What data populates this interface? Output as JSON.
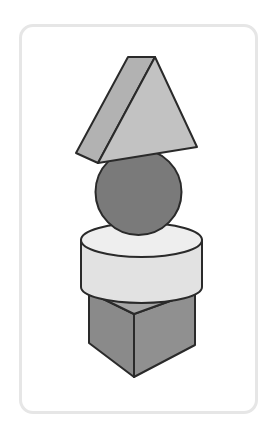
{
  "figure": {
    "stack_order_top_to_bottom": [
      "triangular-prism",
      "sphere",
      "cylinder",
      "cube"
    ],
    "colors": {
      "card_border": "#e6e6e6",
      "stroke": "#2a2a2a",
      "prism_front": "#c2c2c2",
      "prism_side": "#b2b2b2",
      "sphere": "#7a7a7a",
      "cylinder_top": "#eeeeee",
      "cylinder_side": "#e2e2e2",
      "cube_left": "#8a8a8a",
      "cube_right": "#909090",
      "cube_top": "#a6a6a6"
    }
  }
}
